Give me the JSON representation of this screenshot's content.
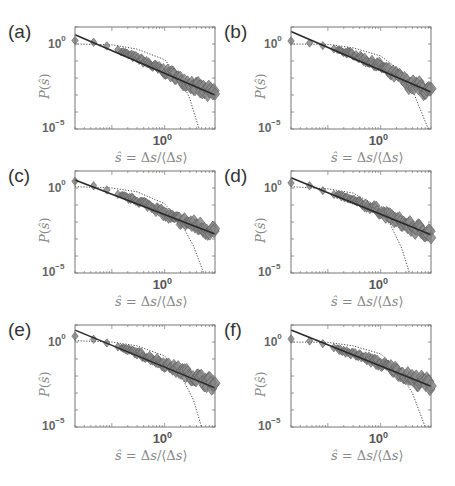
{
  "figure": {
    "panels": [
      {
        "id": "a",
        "label": "(a)"
      },
      {
        "id": "b",
        "label": "(b)"
      },
      {
        "id": "c",
        "label": "(c)"
      },
      {
        "id": "d",
        "label": "(d)"
      },
      {
        "id": "e",
        "label": "(e)"
      },
      {
        "id": "f",
        "label": "(f)"
      }
    ],
    "ytick_top": {
      "base": "10",
      "exp": "0"
    },
    "ytick_bottom": {
      "base": "10",
      "exp": "−5"
    },
    "xtick": {
      "base": "10",
      "exp": "0"
    },
    "xlabel_text": "ŝ = Δs/⟨Δs⟩",
    "ylabel_text": "P(ŝ)",
    "colors": {
      "marker_fill": "#8a8a8a",
      "marker_edge": "#5a5a5a",
      "fit_line": "#2a2a2a",
      "dotted_curve": "#444444",
      "axes": "#777777"
    }
  },
  "chart_data": [
    {
      "panel": "(a)",
      "type": "scatter",
      "xscale": "log",
      "yscale": "log",
      "xlabel": "ŝ = Δs/⟨Δs⟩",
      "ylabel": "P(ŝ)",
      "xticks": [
        "10^0"
      ],
      "yticks": [
        "10^-5",
        "10^0"
      ],
      "ylim": [
        1e-05,
        10
      ],
      "xlim": [
        0.02,
        9
      ],
      "series": [
        {
          "name": "data (diamonds)",
          "style": "gray diamonds",
          "x": [
            0.02,
            0.04,
            0.07,
            0.1,
            0.15,
            0.2,
            0.3,
            0.5,
            0.7,
            1.0,
            1.5,
            2,
            3,
            5,
            8
          ],
          "y": [
            1.6,
            1.4,
            0.9,
            0.6,
            0.4,
            0.25,
            0.15,
            0.07,
            0.04,
            0.025,
            0.015,
            0.008,
            0.005,
            0.002,
            0.0012
          ]
        },
        {
          "name": "power-law fit",
          "style": "solid line",
          "x": [
            0.02,
            9
          ],
          "y": [
            3.5,
            0.001
          ]
        },
        {
          "name": "exponential",
          "style": "dotted line",
          "x": [
            0.02,
            0.1,
            0.3,
            1.0,
            2.0,
            3.0,
            4.5
          ],
          "y": [
            1.0,
            0.9,
            0.5,
            0.12,
            0.01,
            0.0006,
            1e-05
          ]
        }
      ]
    },
    {
      "panel": "(b)",
      "type": "scatter",
      "xscale": "log",
      "yscale": "log",
      "xlabel": "ŝ = Δs/⟨Δs⟩",
      "ylabel": "P(ŝ)",
      "xticks": [
        "10^0"
      ],
      "yticks": [
        "10^-5",
        "10^0"
      ],
      "ylim": [
        1e-05,
        10
      ],
      "xlim": [
        0.02,
        9
      ],
      "series": [
        {
          "name": "data (diamonds)",
          "style": "gray diamonds",
          "x": [
            0.02,
            0.05,
            0.08,
            0.12,
            0.2,
            0.3,
            0.5,
            0.7,
            1.0,
            1.5,
            2.2,
            3.5,
            5.5,
            8
          ],
          "y": [
            1.5,
            1.1,
            0.8,
            0.55,
            0.35,
            0.25,
            0.12,
            0.08,
            0.05,
            0.02,
            0.012,
            0.004,
            0.003,
            0.0015
          ]
        },
        {
          "name": "power-law fit",
          "style": "solid line",
          "x": [
            0.02,
            9
          ],
          "y": [
            5.5,
            0.0015
          ]
        },
        {
          "name": "exponential",
          "style": "dotted line",
          "x": [
            0.02,
            0.1,
            0.3,
            1.0,
            2.0,
            4.0,
            8.0
          ],
          "y": [
            1.0,
            0.95,
            0.6,
            0.2,
            0.04,
            0.002,
            1e-05
          ]
        }
      ]
    },
    {
      "panel": "(c)",
      "type": "scatter",
      "xscale": "log",
      "yscale": "log",
      "xlabel": "ŝ = Δs/⟨Δs⟩",
      "ylabel": "P(ŝ)",
      "xticks": [
        "10^0"
      ],
      "yticks": [
        "10^-5",
        "10^0"
      ],
      "ylim": [
        1e-05,
        10
      ],
      "xlim": [
        0.02,
        9
      ],
      "series": [
        {
          "name": "data (diamonds)",
          "style": "gray diamonds",
          "x": [
            0.02,
            0.04,
            0.07,
            0.1,
            0.15,
            0.25,
            0.4,
            0.6,
            1.0,
            1.5,
            2.5,
            4,
            6,
            8.5
          ],
          "y": [
            2.5,
            1.5,
            0.9,
            0.6,
            0.35,
            0.22,
            0.13,
            0.08,
            0.03,
            0.015,
            0.01,
            0.006,
            0.004,
            0.003
          ]
        },
        {
          "name": "power-law fit",
          "style": "solid line",
          "x": [
            0.02,
            9
          ],
          "y": [
            3.0,
            0.002
          ]
        },
        {
          "name": "exponential",
          "style": "dotted line",
          "x": [
            0.02,
            0.1,
            0.3,
            1.0,
            2.0,
            3.5,
            5.5
          ],
          "y": [
            1.2,
            1.0,
            0.6,
            0.12,
            0.01,
            0.0004,
            1e-05
          ]
        }
      ]
    },
    {
      "panel": "(d)",
      "type": "scatter",
      "xscale": "log",
      "yscale": "log",
      "xlabel": "ŝ = Δs/⟨Δs⟩",
      "ylabel": "P(ŝ)",
      "xticks": [
        "10^0"
      ],
      "yticks": [
        "10^-5",
        "10^0"
      ],
      "ylim": [
        1e-05,
        10
      ],
      "xlim": [
        0.02,
        9
      ],
      "series": [
        {
          "name": "data (diamonds)",
          "style": "gray diamonds",
          "x": [
            0.02,
            0.05,
            0.08,
            0.12,
            0.2,
            0.3,
            0.5,
            0.8,
            1.2,
            1.8,
            2.8,
            4.5,
            7,
            9
          ],
          "y": [
            2.0,
            1.3,
            0.7,
            0.45,
            0.3,
            0.18,
            0.1,
            0.06,
            0.03,
            0.015,
            0.008,
            0.004,
            0.003,
            0.002
          ]
        },
        {
          "name": "power-law fit",
          "style": "solid line",
          "x": [
            0.02,
            9
          ],
          "y": [
            4.0,
            0.0018
          ]
        },
        {
          "name": "exponential",
          "style": "dotted line",
          "x": [
            0.02,
            0.1,
            0.3,
            0.8,
            1.5,
            2.5,
            3.5
          ],
          "y": [
            1.2,
            0.9,
            0.5,
            0.1,
            0.008,
            0.0003,
            1e-05
          ]
        }
      ]
    },
    {
      "panel": "(e)",
      "type": "scatter",
      "xscale": "log",
      "yscale": "log",
      "xlabel": "ŝ = Δs/⟨Δs⟩",
      "ylabel": "P(ŝ)",
      "xticks": [
        "10^0"
      ],
      "yticks": [
        "10^-5",
        "10^0"
      ],
      "ylim": [
        1e-05,
        10
      ],
      "xlim": [
        0.02,
        9
      ],
      "series": [
        {
          "name": "data (diamonds)",
          "style": "gray diamonds",
          "x": [
            0.02,
            0.04,
            0.07,
            0.1,
            0.15,
            0.25,
            0.4,
            0.6,
            1.0,
            1.5,
            2.5,
            4,
            6,
            8.5
          ],
          "y": [
            2.2,
            1.6,
            1.0,
            0.7,
            0.45,
            0.28,
            0.16,
            0.1,
            0.05,
            0.03,
            0.015,
            0.008,
            0.005,
            0.003
          ]
        },
        {
          "name": "power-law fit",
          "style": "solid line",
          "x": [
            0.02,
            9
          ],
          "y": [
            5.0,
            0.002
          ]
        },
        {
          "name": "exponential",
          "style": "dotted line",
          "x": [
            0.02,
            0.1,
            0.3,
            1.0,
            2.0,
            3.5,
            5.0
          ],
          "y": [
            1.2,
            1.0,
            0.6,
            0.15,
            0.012,
            0.0004,
            1e-05
          ]
        }
      ]
    },
    {
      "panel": "(f)",
      "type": "scatter",
      "xscale": "log",
      "yscale": "log",
      "xlabel": "ŝ = Δs/⟨Δs⟩",
      "ylabel": "P(ŝ)",
      "xticks": [
        "10^0"
      ],
      "yticks": [
        "10^-5",
        "10^0"
      ],
      "ylim": [
        1e-05,
        10
      ],
      "xlim": [
        0.02,
        9
      ],
      "series": [
        {
          "name": "data (diamonds)",
          "style": "gray diamonds",
          "x": [
            0.02,
            0.05,
            0.08,
            0.12,
            0.2,
            0.3,
            0.5,
            0.8,
            1.2,
            1.8,
            2.8,
            4.5,
            7,
            9
          ],
          "y": [
            1.5,
            1.1,
            0.8,
            0.5,
            0.3,
            0.2,
            0.12,
            0.07,
            0.04,
            0.025,
            0.012,
            0.006,
            0.004,
            0.003
          ]
        },
        {
          "name": "power-law fit",
          "style": "solid line",
          "x": [
            0.02,
            9
          ],
          "y": [
            5.0,
            0.0025
          ]
        },
        {
          "name": "exponential",
          "style": "dotted line",
          "x": [
            0.02,
            0.1,
            0.3,
            1.0,
            2.0,
            4.0,
            7.0
          ],
          "y": [
            1.0,
            0.95,
            0.6,
            0.2,
            0.03,
            0.001,
            1e-05
          ]
        }
      ]
    }
  ]
}
